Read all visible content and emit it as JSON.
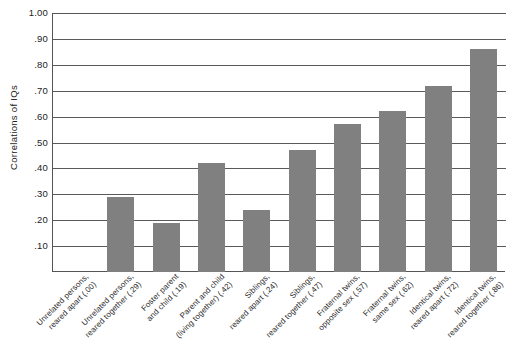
{
  "chart_data": {
    "type": "bar",
    "title": "",
    "subtitle": "",
    "xlabel": "",
    "ylabel": "Correlations of IQs",
    "ylim": [
      0.0,
      1.0
    ],
    "grid": true,
    "legend": null,
    "orientation": "vertical",
    "bar_color": "#808080",
    "axis_color": "#555555",
    "gridline_color": "#5a5a5a",
    "background_color": "#ffffff",
    "ytick_labels": [
      "1.00",
      ".90",
      ".80",
      ".70",
      ".60",
      ".50",
      ".40",
      ".30",
      ".20",
      ".10"
    ],
    "ytick_values": [
      1.0,
      0.9,
      0.8,
      0.7,
      0.6,
      0.5,
      0.4,
      0.3,
      0.2,
      0.1
    ],
    "categories": [
      "Unrelated persons, reared apart (.00)",
      "Unrelated persons, reared together (.29)",
      "Foster parent and child (.19)",
      "Parent and child (living together) (.42)",
      "Siblings, reared apart (.24)",
      "Siblings, reared together (.47)",
      "Fraternal twins, opposite sex (.57)",
      "Fraternal twins, same sex (.62)",
      "Identical twins, reared apart (.72)",
      "Identical twins, reared together (.86)"
    ],
    "category_lines": [
      [
        "Unrelated persons,",
        "reared apart (.00)"
      ],
      [
        "Unrelated persons,",
        "reared together (.29)"
      ],
      [
        "Foster parent",
        "and child (.19)"
      ],
      [
        "Parent and child",
        "(living together) (.42)"
      ],
      [
        "Siblings,",
        "reared apart (.24)"
      ],
      [
        "Siblings,",
        "reared together (.47)"
      ],
      [
        "Fraternal twins,",
        "opposite sex (.57)"
      ],
      [
        "Fraternal twins,",
        "same sex (.62)"
      ],
      [
        "Identical twins,",
        "reared apart (.72)"
      ],
      [
        "Identical twins,",
        "reared together (.86)"
      ]
    ],
    "values": [
      0.0,
      0.29,
      0.19,
      0.42,
      0.24,
      0.47,
      0.57,
      0.62,
      0.72,
      0.86
    ]
  }
}
